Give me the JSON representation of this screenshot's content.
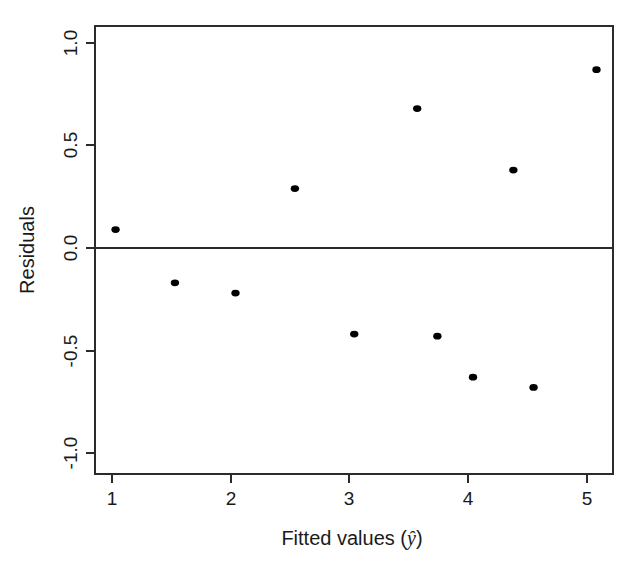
{
  "chart_data": {
    "type": "scatter",
    "title": "",
    "xlabel": "Fitted values (ŷ)",
    "ylabel": "Residuals",
    "xlim": [
      0.84,
      5.22
    ],
    "ylim": [
      -1.12,
      1.09
    ],
    "grid": false,
    "legend": null,
    "xticks": [
      1,
      2,
      3,
      4,
      5
    ],
    "xtick_labels": [
      "1",
      "2",
      "3",
      "4",
      "5"
    ],
    "yticks": [
      1.0,
      0.5,
      0.0,
      -0.5,
      -1.0
    ],
    "ytick_labels": [
      "1.0",
      "0.5",
      "0.0",
      "-0.5",
      "-1.0"
    ],
    "reference_line": {
      "orientation": "horizontal",
      "y": 0.0
    },
    "points": [
      {
        "x": 1.03,
        "y": 0.09
      },
      {
        "x": 1.53,
        "y": -0.17
      },
      {
        "x": 2.04,
        "y": -0.22
      },
      {
        "x": 2.54,
        "y": 0.29
      },
      {
        "x": 3.04,
        "y": -0.42
      },
      {
        "x": 3.57,
        "y": 0.68
      },
      {
        "x": 3.74,
        "y": -0.43
      },
      {
        "x": 4.04,
        "y": -0.63
      },
      {
        "x": 4.38,
        "y": 0.38
      },
      {
        "x": 4.55,
        "y": -0.68
      },
      {
        "x": 5.08,
        "y": 0.87
      }
    ]
  },
  "axis_labels": {
    "x_prefix": "Fitted values (",
    "x_symbol": "ŷ",
    "x_suffix": ")",
    "y": "Residuals"
  }
}
